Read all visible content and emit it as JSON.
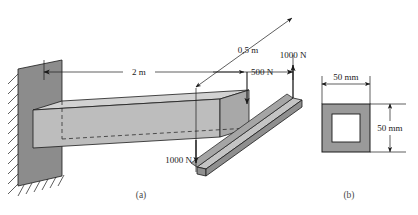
{
  "figure": {
    "type": "engineering-diagram",
    "parts": [
      {
        "id": "a",
        "label": "(a)",
        "caption": "(a)"
      },
      {
        "id": "b",
        "label": "(b)",
        "caption": "(b)"
      }
    ]
  },
  "beam_view": {
    "name": "part-a-cantilever-beam",
    "support": {
      "type": "fixed-wall",
      "name": "wall-support",
      "hatching": "true"
    },
    "dimensions": [
      {
        "name": "beam-length",
        "value": "2 m",
        "orientation": "horizontal"
      },
      {
        "name": "arm-offset",
        "value": "0,5 m",
        "orientation": "diagonal"
      }
    ],
    "loads": [
      {
        "name": "load-500n-down",
        "value": "500 N",
        "direction": "down",
        "applied_at": "beam-top-near-end"
      },
      {
        "name": "load-1000n-up",
        "value": "1000 N",
        "direction": "up",
        "applied_at": "arm-far-end"
      },
      {
        "name": "load-1000n-down",
        "value": "1000 N",
        "direction": "down",
        "applied_at": "arm-near-end"
      }
    ]
  },
  "cross_section": {
    "name": "part-b-cross-section",
    "shape": "hollow-square-tube",
    "dimensions": [
      {
        "name": "width-dimension",
        "value": "50 mm",
        "orientation": "horizontal"
      },
      {
        "name": "height-dimension",
        "value": "50 mm",
        "orientation": "vertical"
      }
    ]
  },
  "colors": {
    "wall_face": "#8c8c8c",
    "beam_top": "#d2d2d2",
    "beam_front": "#bdbdbd",
    "beam_end": "#a8a8a8",
    "arm_light": "#c4c4c4",
    "arm_dark": "#8f8f8f",
    "section_wall": "#9a9a9a",
    "line": "#1a1a1a",
    "text": "#1a1a1a",
    "caption": "#4a4a4a"
  }
}
